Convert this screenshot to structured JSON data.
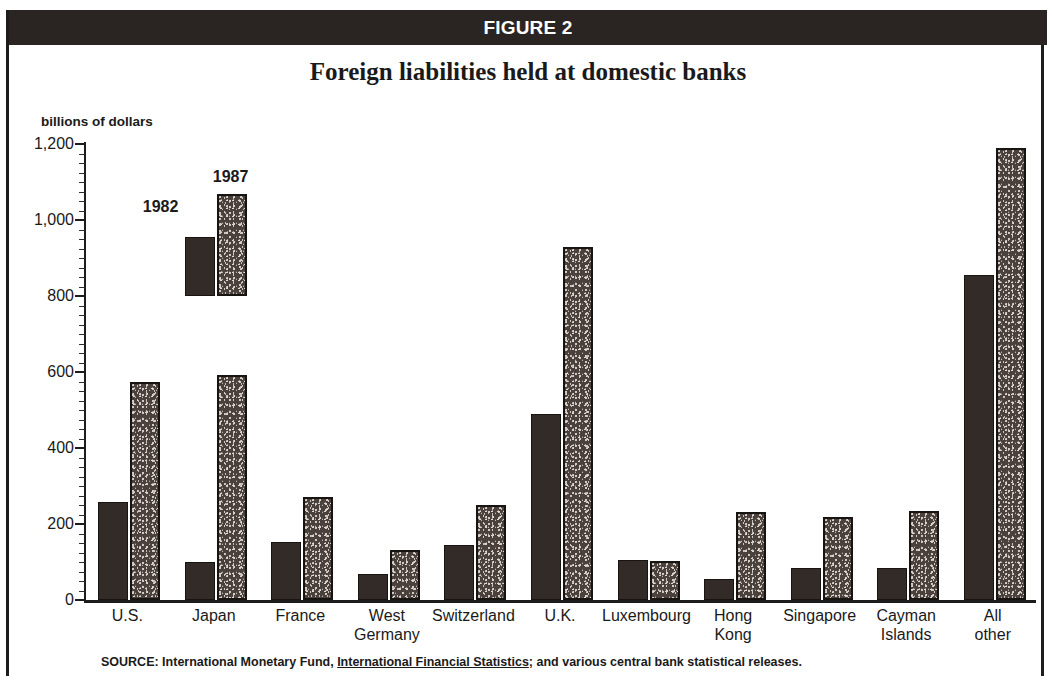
{
  "figure": {
    "header_label": "FIGURE 2",
    "title": "Foreign liabilities held at domestic banks",
    "source_prefix": "SOURCE: International Monetary Fund, ",
    "source_italic_title": "International Financial Statistics",
    "source_suffix": "; and various central bank statistical releases."
  },
  "legend": {
    "series_1_label": "1982",
    "series_2_label": "1987"
  },
  "chart_data": {
    "type": "bar",
    "title": "Foreign liabilities held at domestic banks",
    "xlabel": "",
    "ylabel": "billions of dollars",
    "ylim": [
      0,
      1200
    ],
    "yticks": [
      0,
      200,
      400,
      600,
      800,
      1000,
      1200
    ],
    "ytick_labels": [
      "0",
      "200",
      "400",
      "600",
      "800",
      "1,000",
      "1,200"
    ],
    "grid": false,
    "legend_position": "inside-upper-left",
    "categories": [
      "U.S.",
      "Japan",
      "France",
      "West Germany",
      "Switzerland",
      "U.K.",
      "Luxembourg",
      "Hong Kong",
      "Singapore",
      "Cayman Islands",
      "All other"
    ],
    "category_lines": [
      [
        "U.S."
      ],
      [
        "Japan"
      ],
      [
        "France"
      ],
      [
        "West",
        "Germany"
      ],
      [
        "Switzerland"
      ],
      [
        "U.K."
      ],
      [
        "Luxembourg"
      ],
      [
        "Hong",
        "Kong"
      ],
      [
        "Singapore"
      ],
      [
        "Cayman",
        "Islands"
      ],
      [
        "All",
        "other"
      ]
    ],
    "series": [
      {
        "name": "1982",
        "values": [
          258,
          100,
          152,
          68,
          145,
          490,
          105,
          55,
          85,
          85,
          855
        ]
      },
      {
        "name": "1987",
        "values": [
          573,
          593,
          270,
          132,
          250,
          928,
          102,
          232,
          218,
          235,
          1190
        ]
      }
    ]
  },
  "colors": {
    "header_band": "#2a2522",
    "series_1982": "#322b27",
    "series_1987": "#4a413c",
    "axis": "#1c1c1c",
    "text": "#1a1a1a",
    "background": "#ffffff"
  }
}
